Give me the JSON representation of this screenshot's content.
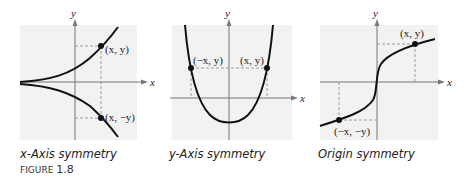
{
  "figure": {
    "label": "FIGURE",
    "number": "1.8"
  },
  "graphs": [
    {
      "caption": "x-Axis symmetry",
      "axis_x": "x",
      "axis_y": "y",
      "points": [
        "(x, y)",
        "(x, −y)"
      ]
    },
    {
      "caption": "y-Axis symmetry",
      "axis_x": "x",
      "axis_y": "y",
      "points": [
        "(−x, y)",
        "(x, y)"
      ]
    },
    {
      "caption": "Origin symmetry",
      "axis_x": "x",
      "axis_y": "y",
      "points": [
        "(x, y)",
        "(−x, −y)"
      ]
    }
  ],
  "colors": {
    "panel": "#f2f2f2",
    "curve": "#111111",
    "axis": "#777777",
    "guide": "#888888"
  }
}
